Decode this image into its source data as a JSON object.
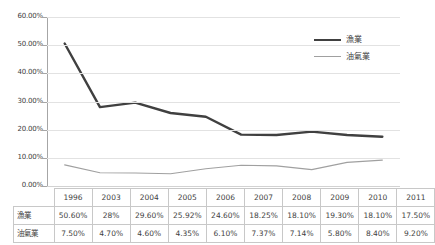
{
  "chart_data": {
    "type": "line",
    "title": "",
    "xlabel": "",
    "ylabel": "",
    "categories": [
      "1996",
      "2003",
      "2004",
      "2005",
      "2006",
      "2007",
      "2008",
      "2009",
      "2010",
      "2011"
    ],
    "ylim": [
      0,
      0.6
    ],
    "ytick_labels": [
      "60.00%",
      "50.00%",
      "40.00%",
      "30.00%",
      "20.00%",
      "10.00%",
      "0.00%"
    ],
    "ytick_values": [
      0.6,
      0.5,
      0.4,
      0.3,
      0.2,
      0.1,
      0.0
    ],
    "grid": true,
    "legend_position": "top-right",
    "series": [
      {
        "name": "漁業",
        "color": "#404040",
        "width": 2.4,
        "values": [
          0.506,
          0.28,
          0.296,
          0.2592,
          0.246,
          0.1825,
          0.181,
          0.193,
          0.181,
          0.175
        ],
        "labels": [
          "50.60%",
          "28%",
          "29.60%",
          "25.92%",
          "24.60%",
          "18.25%",
          "18.10%",
          "19.30%",
          "18.10%",
          "17.50%"
        ]
      },
      {
        "name": "油氣業",
        "color": "#a0a0a0",
        "width": 1.1,
        "values": [
          0.075,
          0.047,
          0.046,
          0.0435,
          0.061,
          0.0737,
          0.0714,
          0.058,
          0.084,
          0.092
        ],
        "labels": [
          "7.50%",
          "4.70%",
          "4.60%",
          "4.35%",
          "6.10%",
          "7.37%",
          "7.14%",
          "5.80%",
          "8.40%",
          "9.20%"
        ]
      }
    ]
  },
  "legend": {
    "items": [
      {
        "label": "漁業"
      },
      {
        "label": "油氣業"
      }
    ]
  },
  "table": {
    "corner": "",
    "header": [
      "1996",
      "2003",
      "2004",
      "2005",
      "2006",
      "2007",
      "2008",
      "2009",
      "2010",
      "2011"
    ],
    "rows": [
      {
        "label": "漁業",
        "values": [
          "50.60%",
          "28%",
          "29.60%",
          "25.92%",
          "24.60%",
          "18.25%",
          "18.10%",
          "19.30%",
          "18.10%",
          "17.50%"
        ]
      },
      {
        "label": "油氣業",
        "values": [
          "7.50%",
          "4.70%",
          "4.60%",
          "4.35%",
          "6.10%",
          "7.37%",
          "7.14%",
          "5.80%",
          "8.40%",
          "9.20%"
        ]
      }
    ]
  },
  "colors": {
    "series1": "#404040",
    "series2": "#a0a0a0",
    "grid": "#e2e2e2",
    "axis": "#a6a6a6",
    "table_border": "#c8c8c8",
    "text": "#3f3f3f"
  }
}
